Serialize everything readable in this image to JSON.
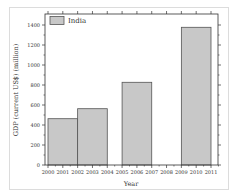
{
  "chart_data": {
    "type": "bar",
    "title": "",
    "xlabel": "Year",
    "ylabel": "GDP (current US$) (million)",
    "legend": [
      "India"
    ],
    "legend_position": "upper-left",
    "x_ticks": [
      "2000",
      "2001",
      "2002",
      "2003",
      "2004",
      "2005",
      "2006",
      "2007",
      "2008",
      "2009",
      "2010",
      "2011"
    ],
    "y_ticks": [
      0,
      200,
      400,
      600,
      800,
      1000,
      1200,
      1400
    ],
    "ylim": [
      0,
      1500
    ],
    "xlim": [
      1999.8,
      2011.5
    ],
    "grid": false,
    "series": [
      {
        "name": "India",
        "bars": [
          {
            "x_start": 2000,
            "x_end": 2002,
            "value": 463
          },
          {
            "x_start": 2002,
            "x_end": 2004,
            "value": 563
          },
          {
            "x_start": 2005,
            "x_end": 2007,
            "value": 827
          },
          {
            "x_start": 2009,
            "x_end": 2011,
            "value": 1377
          }
        ]
      }
    ],
    "colors": {
      "bar_fill": "#c8c8c8",
      "bar_stroke": "#555555",
      "axis": "#333333"
    }
  }
}
